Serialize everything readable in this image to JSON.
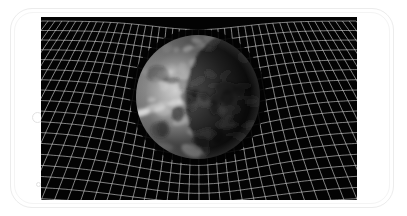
{
  "device": {
    "type": "smartphone",
    "orientation": "landscape",
    "frame_color": "#ececec",
    "controls": [
      {
        "name": "home-button",
        "shape": "circle"
      },
      {
        "name": "sensor-dot",
        "shape": "small-circle"
      }
    ]
  },
  "screen": {
    "background_color": "#030303",
    "content": "Earth warping a spacetime grid (gravity well illustration)",
    "caption": "Earth bending the fabric of spacetime",
    "earth": {
      "cx": 157,
      "cy": 80,
      "r": 62,
      "lit_side": "left",
      "palette": [
        "#e4e4e4",
        "#9a9a9a",
        "#5a5a5a",
        "#1e1e1e",
        "#050505"
      ]
    },
    "grid": {
      "line_color": "#d8d8d8",
      "line_opacity": 0.85,
      "columns": 30,
      "rows": 18,
      "well_depth": 46,
      "well_radius": 120
    }
  }
}
